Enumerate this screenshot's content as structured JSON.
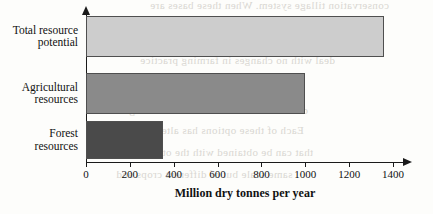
{
  "chart_data": {
    "type": "bar",
    "orientation": "horizontal",
    "title": "",
    "categories": [
      "Total resource potential",
      "Agricultural resources",
      "Forest resources"
    ],
    "category_lines": [
      [
        "Total resource",
        "potential"
      ],
      [
        "Agricultural",
        "resources"
      ],
      [
        "Forest",
        "resources"
      ]
    ],
    "values": [
      1360,
      1000,
      350
    ],
    "xlabel": "Million dry tonnes per year",
    "ylabel": "",
    "xlim": [
      0,
      1450
    ],
    "xticks": [
      0,
      200,
      400,
      600,
      800,
      1000,
      1200,
      1400
    ],
    "xtick_labels": [
      "0",
      "200",
      "400",
      "600",
      "800",
      "1000",
      "1200",
      "1400"
    ],
    "grid": false,
    "legend": false,
    "bar_colors": [
      "#cdcdcd",
      "#8a8a8a",
      "#4a4a4a"
    ],
    "bar_edge_color": "#4f4f4f",
    "axis_color": "#1a1a1a"
  },
  "background_bleed": [
    {
      "text": "conservation tillage system. When these bases are",
      "x": 150,
      "y": -1
    },
    {
      "text": "used the soil are less and the erosion is reduced",
      "x": 120,
      "y": 30
    },
    {
      "text": "deal with no changes in farming practice",
      "x": 140,
      "y": 54
    },
    {
      "text": "examples of these biomass production",
      "x": 110,
      "y": 82
    },
    {
      "text": "of biomass and residues that can be grown",
      "x": 105,
      "y": 104
    },
    {
      "text": "Each of these options has alternative",
      "x": 128,
      "y": 124
    },
    {
      "text": "that can be obtained with the other crops",
      "x": 118,
      "y": 146
    },
    {
      "text": "same scale but of different crops and",
      "x": 116,
      "y": 168
    }
  ]
}
